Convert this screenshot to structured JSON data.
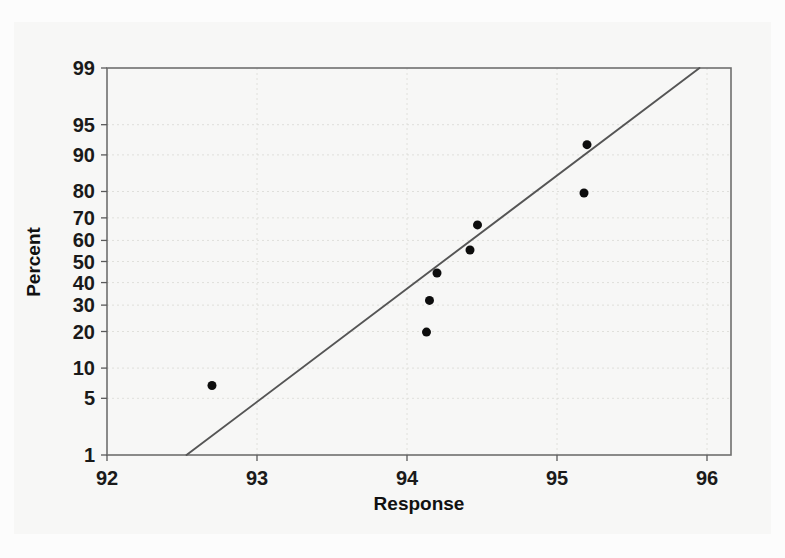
{
  "figure": {
    "name": "normal-probability-plot",
    "background_color": "#fcfcfc",
    "paper_color": "#f7f7f6"
  },
  "chart_data": {
    "type": "scatter",
    "title": "",
    "subtitle": "",
    "xlabel": "Response",
    "ylabel": "Percent",
    "xlim": [
      92,
      96.16
    ],
    "ylim": [
      1,
      99
    ],
    "yscale": "normal-probability",
    "grid": true,
    "legend": "none",
    "x_ticks": [
      92,
      93,
      94,
      95,
      96
    ],
    "x_tick_labels": [
      "92",
      "93",
      "94",
      "95",
      "96"
    ],
    "y_ticks": [
      1,
      5,
      10,
      20,
      30,
      40,
      50,
      60,
      70,
      80,
      90,
      95,
      99
    ],
    "y_tick_labels": [
      "1",
      "5",
      "10",
      "20",
      "30",
      "40",
      "50",
      "60",
      "70",
      "80",
      "90",
      "95",
      "99"
    ],
    "marker": {
      "shape": "circle",
      "color": "#0d0d0d",
      "size": 9
    },
    "points": [
      {
        "x": 92.7,
        "y": 6.8
      },
      {
        "x": 94.13,
        "y": 19.8
      },
      {
        "x": 94.15,
        "y": 32.0
      },
      {
        "x": 94.2,
        "y": 44.5
      },
      {
        "x": 94.42,
        "y": 55.5
      },
      {
        "x": 94.47,
        "y": 67.0
      },
      {
        "x": 95.18,
        "y": 79.5
      },
      {
        "x": 95.2,
        "y": 92.0
      }
    ],
    "fit_line": {
      "name": "normal-reference-line",
      "color": "#555555",
      "x_start": 92.53,
      "y_start": 1,
      "x_end": 95.95,
      "y_end": 99
    },
    "annotations": []
  }
}
